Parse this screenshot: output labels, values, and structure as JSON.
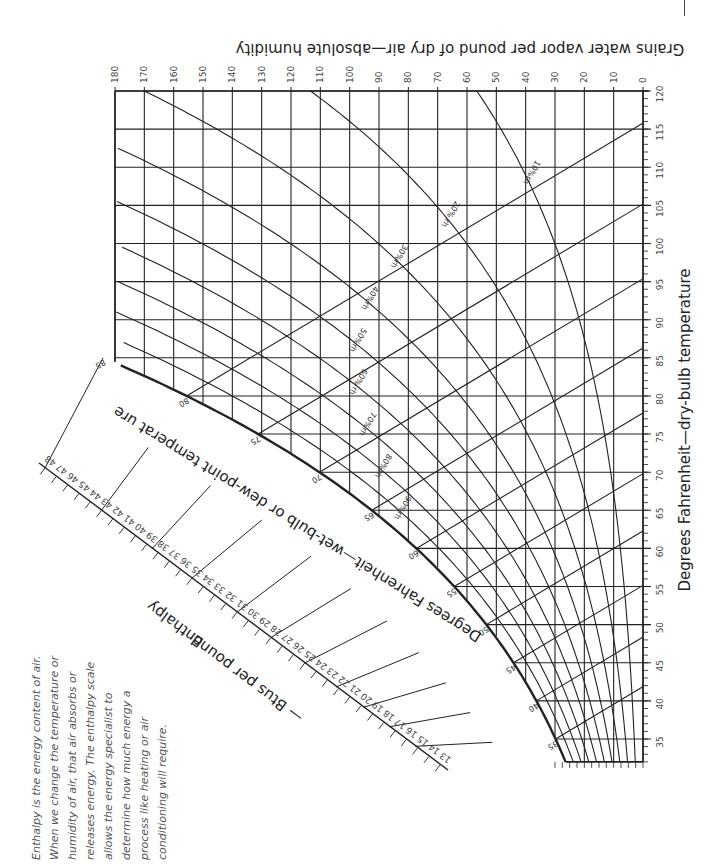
{
  "chart_data": {
    "type": "line",
    "orientation": "rotated 90 degrees (dry-bulb axis vertical on right, humidity axis horizontal on top)",
    "xlabel": "Degrees Fahrenheit—dry-bulb temperature",
    "ylabel": "Grains water vapor per pound of dry air—absolute humidity",
    "saturation_label": "Degrees Fahrenheit—wet-bulb or dew-point temperat ure",
    "enthalpy_label": "Enthalpy",
    "enthalpy_units": "— Btus per pound",
    "xlim": [
      32,
      120
    ],
    "ylim": [
      0,
      180
    ],
    "dry_bulb_ticks": [
      35,
      40,
      45,
      50,
      55,
      60,
      65,
      70,
      75,
      80,
      85,
      90,
      95,
      100,
      105,
      110,
      115,
      120
    ],
    "humidity_ticks": [
      0,
      10,
      20,
      30,
      40,
      50,
      60,
      70,
      80,
      90,
      100,
      110,
      120,
      130,
      140,
      150,
      160,
      170,
      180
    ],
    "saturation_ticks": [
      35,
      40,
      45,
      50,
      55,
      60,
      65,
      70,
      75,
      80,
      85
    ],
    "enthalpy_ticks": [
      13,
      14,
      15,
      16,
      17,
      18,
      19,
      20,
      21,
      22,
      23,
      24,
      25,
      26,
      27,
      28,
      29,
      30,
      31,
      32,
      33,
      34,
      35,
      36,
      37,
      38,
      39,
      40,
      41,
      42,
      43,
      44,
      45,
      46,
      47,
      48
    ],
    "relative_humidity_curves": [
      {
        "label": "10%rh",
        "rh": 0.1
      },
      {
        "label": "20% rh",
        "rh": 0.2
      },
      {
        "label": "30%rh",
        "rh": 0.3
      },
      {
        "label": "40%rh",
        "rh": 0.4
      },
      {
        "label": "50%rh",
        "rh": 0.5
      },
      {
        "label": "60% rh",
        "rh": 0.6
      },
      {
        "label": "70%rh",
        "rh": 0.7
      },
      {
        "label": "80%rh",
        "rh": 0.8
      },
      {
        "label": "90%rh",
        "rh": 0.9
      }
    ],
    "saturation_curve": {
      "dry_bulb": [
        32,
        35,
        40,
        45,
        50,
        55,
        60,
        65,
        70,
        75,
        80,
        85
      ],
      "grains": [
        26,
        30,
        36,
        44,
        54,
        64,
        77,
        92,
        110,
        130,
        155,
        183
      ]
    },
    "grid": true
  },
  "sidebar_note": "Enthalpy is the energy content of air. When we change the temperature or humidity of air, that air absorbs or releases energy. The enthalpy scale allows the energy specialist to determine how much energy a process like heating or air conditioning will require.",
  "colors": {
    "ink": "#222222",
    "grid": "#333333",
    "text": "#444444",
    "background": "#ffffff"
  }
}
